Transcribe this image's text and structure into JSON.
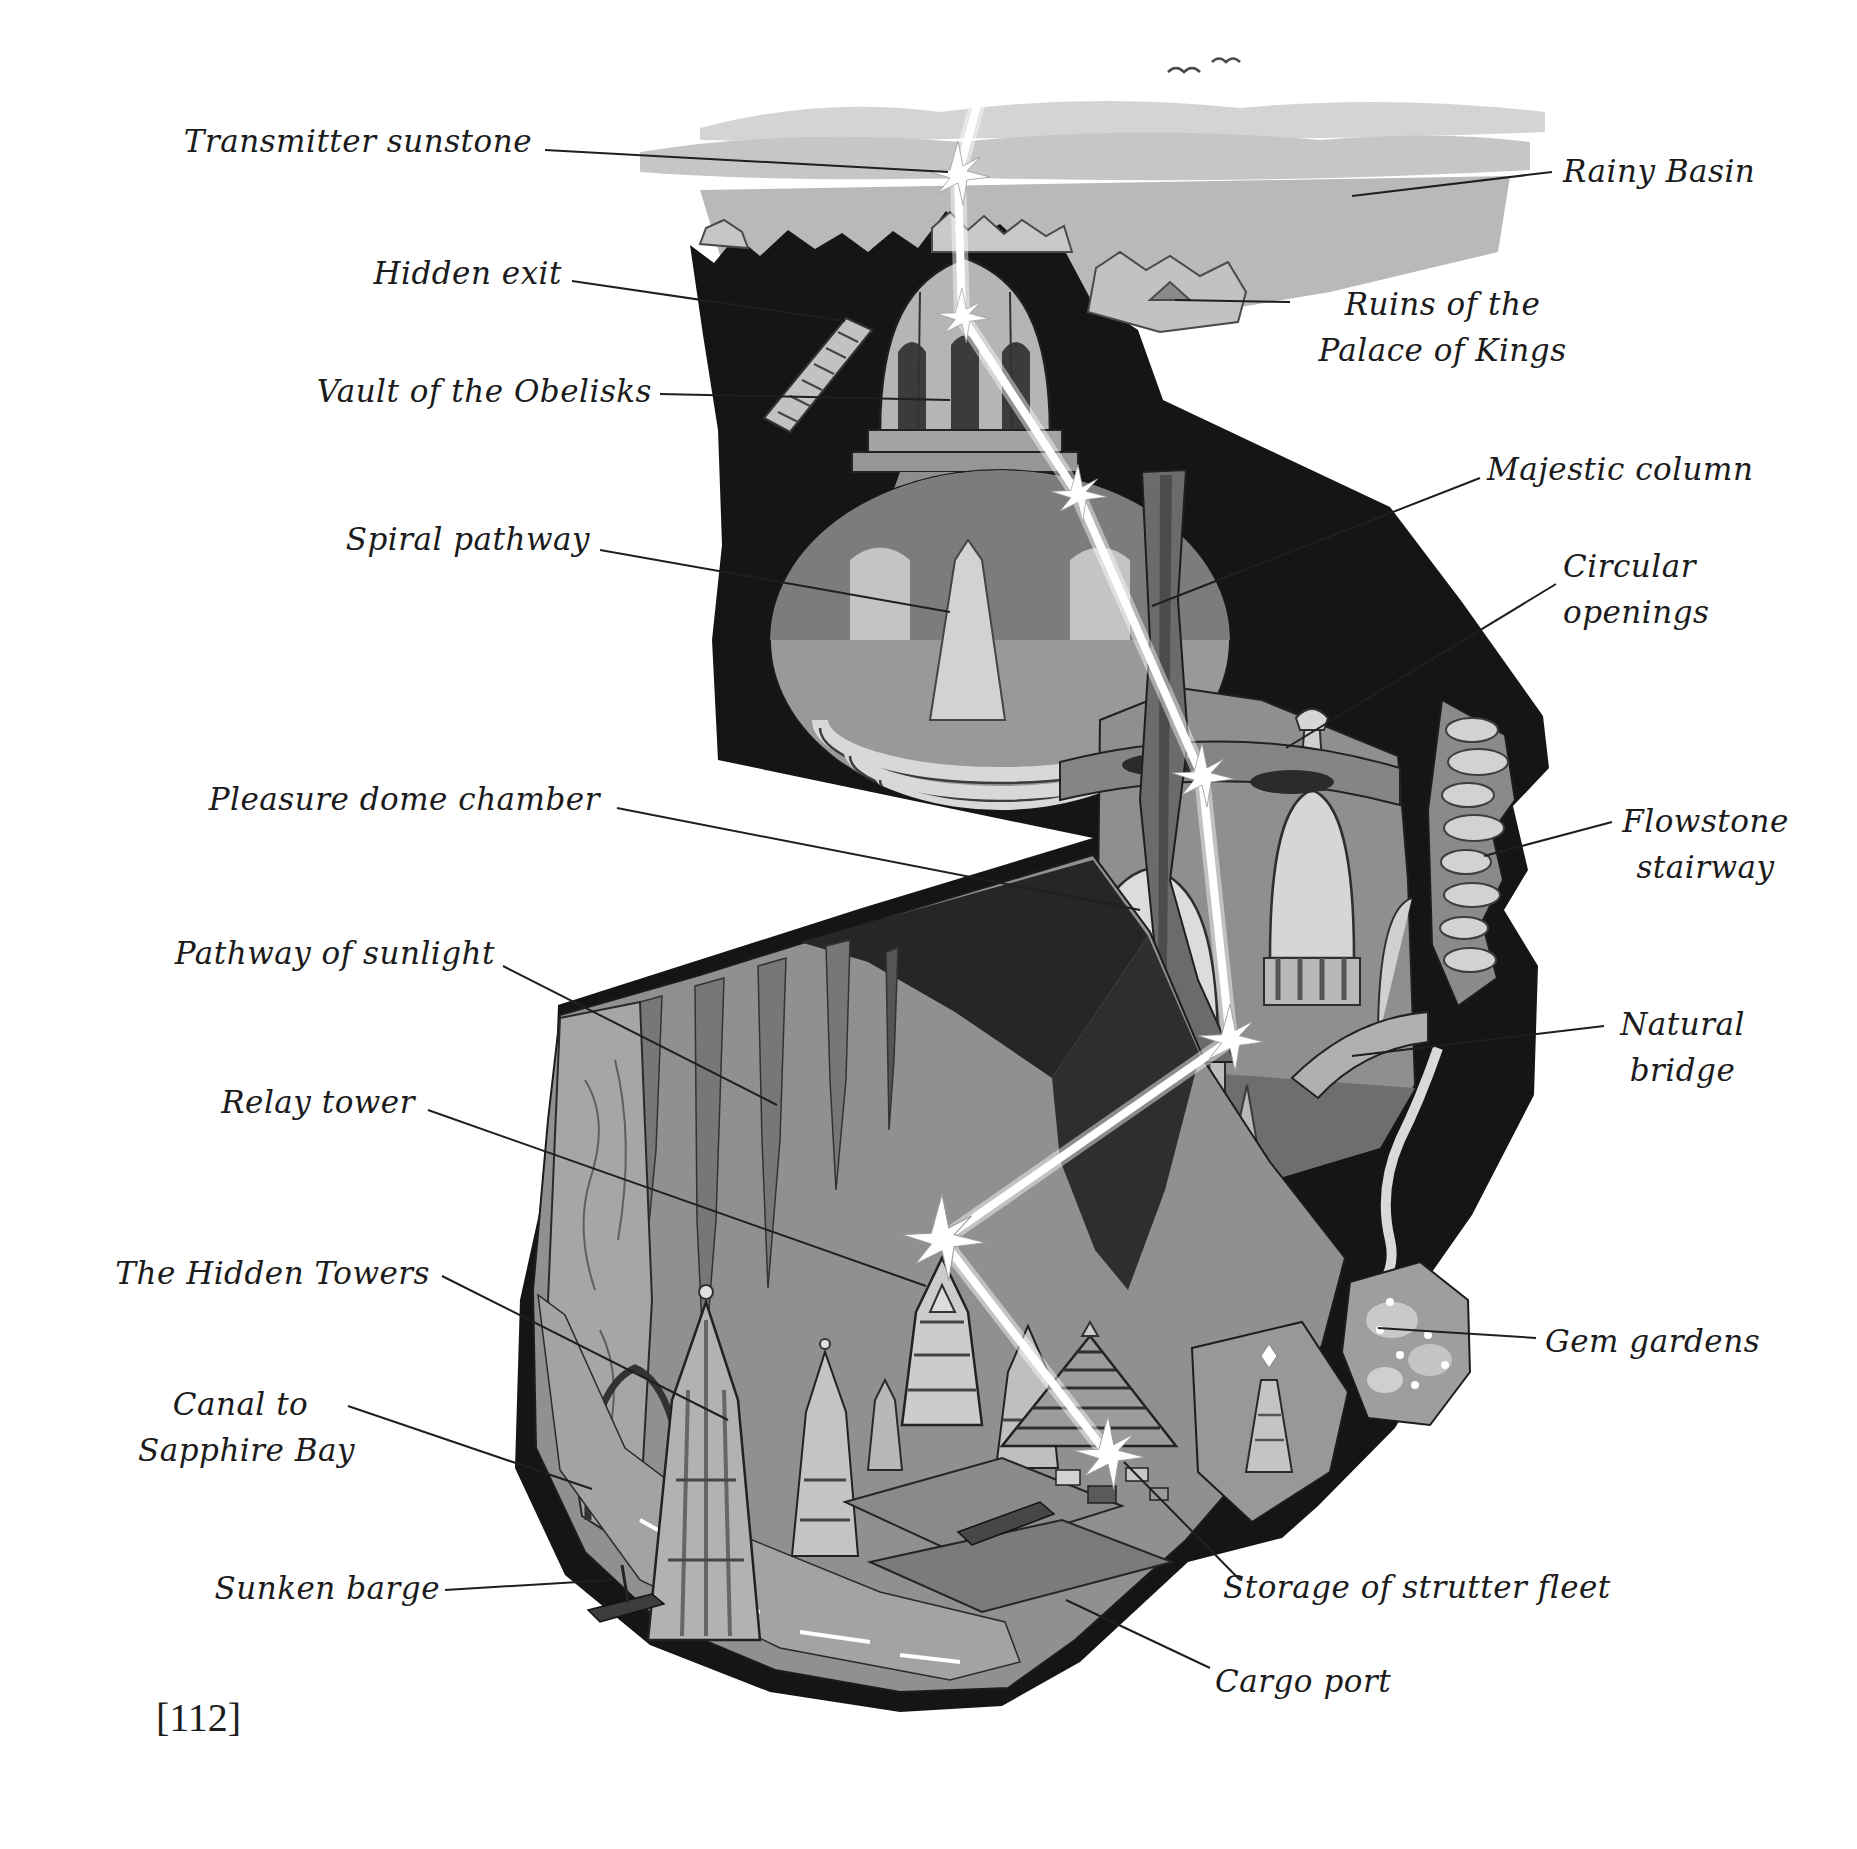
{
  "page": {
    "number": "[112]",
    "background_color": "#ffffff",
    "ink_color": "#1b1b1b"
  },
  "figure": {
    "type": "annotated-cutaway-illustration",
    "palette": {
      "rock_black": "#151515",
      "cavern_gray": "#8f8f8f",
      "structure_light": "#d6d6d6",
      "cloud_gray": "#c6c6c6",
      "water_gray": "#a3a3a3",
      "beam_white": "#ffffff"
    },
    "icons": {
      "sunbeam_star": "six-point white light flare",
      "bird": "distant bird glyph"
    }
  },
  "labels": {
    "transmitter_sunstone": "Transmitter sunstone",
    "hidden_exit": "Hidden exit",
    "vault_of_the_obelisks": "Vault of the Obelisks",
    "spiral_pathway": "Spiral pathway",
    "pleasure_dome_chamber": "Pleasure dome chamber",
    "pathway_of_sunlight": "Pathway of sunlight",
    "relay_tower": "Relay tower",
    "the_hidden_towers": "The Hidden Towers",
    "canal_to_sapphire_bay_line1": "Canal to",
    "canal_to_sapphire_bay_line2": "Sapphire Bay",
    "sunken_barge": "Sunken barge",
    "rainy_basin": "Rainy Basin",
    "ruins_of_the_palace_of_kings_line1": "Ruins of the",
    "ruins_of_the_palace_of_kings_line2": "Palace of Kings",
    "majestic_column": "Majestic column",
    "circular_openings_line1": "Circular",
    "circular_openings_line2": "openings",
    "flowstone_stairway_line1": "Flowstone",
    "flowstone_stairway_line2": "stairway",
    "natural_bridge_line1": "Natural",
    "natural_bridge_line2": "bridge",
    "gem_gardens": "Gem gardens",
    "storage_of_strutter_fleet": "Storage of strutter fleet",
    "cargo_port": "Cargo port"
  }
}
